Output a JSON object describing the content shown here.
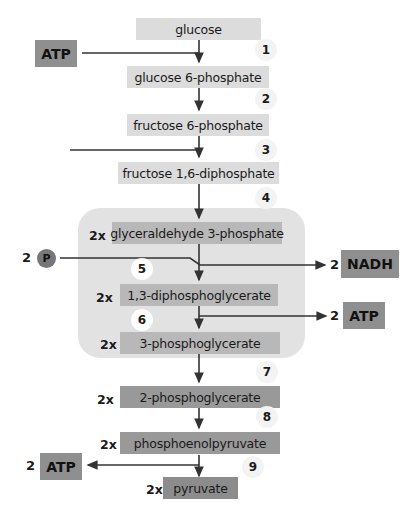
{
  "diagram": {
    "title_fragment": "Glycolysis pathway",
    "metabolites": [
      {
        "id": "glucose",
        "label": "glucose",
        "multiplier": ""
      },
      {
        "id": "g6p",
        "label": "glucose 6-phosphate",
        "multiplier": ""
      },
      {
        "id": "f6p",
        "label": "fructose 6-phosphate",
        "multiplier": ""
      },
      {
        "id": "f16dp",
        "label": "fructose 1,6-diphosphate",
        "multiplier": ""
      },
      {
        "id": "g3p",
        "label": "glyceraldehyde 3-phosphate",
        "multiplier": "2x"
      },
      {
        "id": "bpg",
        "label": "1,3-diphosphoglycerate",
        "multiplier": "2x"
      },
      {
        "id": "3pg",
        "label": "3-phosphoglycerate",
        "multiplier": "2x"
      },
      {
        "id": "2pg",
        "label": "2-phosphoglycerate",
        "multiplier": "2x"
      },
      {
        "id": "pep",
        "label": "phosphoenolpyruvate",
        "multiplier": "2x"
      },
      {
        "id": "pyruvate",
        "label": "pyruvate",
        "multiplier": "2x"
      }
    ],
    "steps": [
      "1",
      "2",
      "3",
      "4",
      "5",
      "6",
      "7",
      "8",
      "9"
    ],
    "inputs": {
      "atp_in": {
        "label": "ATP"
      },
      "phosphate": {
        "coef": "2",
        "label": "P"
      }
    },
    "outputs": {
      "nadh": {
        "coef": "2",
        "label": "NADH"
      },
      "atp_out_6": {
        "coef": "2",
        "label": "ATP"
      },
      "atp_out_9": {
        "coef": "2",
        "label": "ATP"
      }
    },
    "colors": {
      "light_box": "#dcdcdc",
      "mid_box": "#b8b8b8",
      "dark_box": "#999999",
      "external_box": "#8f8f8f",
      "panel": "#e2e2e2",
      "line": "#333333"
    }
  }
}
